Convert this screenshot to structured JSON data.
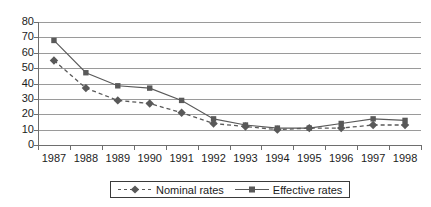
{
  "chart_data": {
    "type": "line",
    "title": "",
    "subtitle": "",
    "xlabel": "",
    "ylabel": "",
    "categories": [
      "1987",
      "1988",
      "1989",
      "1990",
      "1991",
      "1992",
      "1993",
      "1994",
      "1995",
      "1996",
      "1997",
      "1998"
    ],
    "ylim": [
      0,
      80
    ],
    "yticks": [
      0,
      10,
      20,
      30,
      40,
      50,
      60,
      70,
      80
    ],
    "grid": true,
    "legend_position": "bottom",
    "series": [
      {
        "name": "Nominal rates",
        "marker": "diamond",
        "linestyle": "dashed",
        "color": "#595959",
        "values": [
          55,
          37,
          29,
          27,
          21,
          14,
          12,
          10,
          11,
          11,
          13,
          13
        ]
      },
      {
        "name": "Effective rates",
        "marker": "square",
        "linestyle": "solid",
        "color": "#595959",
        "values": [
          68,
          47,
          38.5,
          37,
          29,
          17,
          13,
          11,
          11,
          14,
          17,
          16
        ]
      }
    ]
  },
  "legend": {
    "items": [
      {
        "label": "Nominal rates"
      },
      {
        "label": "Effective rates"
      }
    ]
  },
  "axes": {
    "y_tick_labels": [
      "80",
      "70",
      "60",
      "50",
      "40",
      "30",
      "20",
      "10",
      "0"
    ],
    "x_tick_labels": [
      "1987",
      "1988",
      "1989",
      "1990",
      "1991",
      "1992",
      "1993",
      "1994",
      "1995",
      "1996",
      "1997",
      "1998"
    ]
  },
  "colors": {
    "series": "#595959",
    "gridline": "#9a9a9a",
    "axis": "#6e6e6e",
    "text": "#1c1c1c",
    "background": "#ffffff"
  }
}
